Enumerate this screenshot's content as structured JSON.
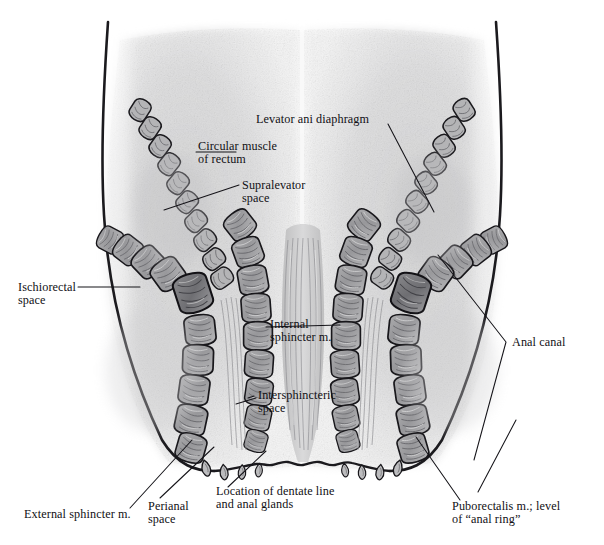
{
  "figure": {
    "view": "coronal-section",
    "background_color": "#ffffff",
    "ink_color": "#111014",
    "tissue_color": "#c9c9ca",
    "muscle_color": "#9a9a9c"
  },
  "labels": {
    "levator_ani": "Levator ani diaphragm",
    "circular_muscle": "Circular muscle\nof rectum",
    "supralevator": "Supralevator\nspace",
    "ischiorectal": "Ischiorectal\nspace",
    "internal_sphincter": "Internal\nsphincter m.",
    "intersphincteric": "Intersphincteric\nspace",
    "anal_canal": "Anal canal",
    "external_sphincter": "External sphincter m.",
    "perianal": "Perianal\nspace",
    "dentate_line": "Location of dentate line\nand anal glands",
    "puborectalis": "Puborectalis m.; level\nof “anal ring”"
  },
  "structures": [
    {
      "name": "levator-ani-diaphragm",
      "side": "both"
    },
    {
      "name": "circular-muscle-of-rectum",
      "side": "left"
    },
    {
      "name": "supralevator-space",
      "side": "left"
    },
    {
      "name": "ischiorectal-space",
      "side": "left"
    },
    {
      "name": "internal-sphincter-muscle",
      "side": "both"
    },
    {
      "name": "external-sphincter-muscle",
      "side": "both"
    },
    {
      "name": "intersphincteric-space",
      "side": "left"
    },
    {
      "name": "anal-canal",
      "side": "center"
    },
    {
      "name": "perianal-space",
      "side": "left"
    },
    {
      "name": "dentate-line",
      "side": "center"
    },
    {
      "name": "anal-glands",
      "side": "both"
    },
    {
      "name": "puborectalis-muscle",
      "side": "right"
    }
  ]
}
